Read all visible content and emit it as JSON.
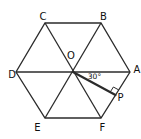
{
  "figure": {
    "labels": {
      "A": "A",
      "B": "B",
      "C": "C",
      "D": "D",
      "E": "E",
      "F": "F",
      "O": "O",
      "P": "P"
    },
    "angle_label": "30°",
    "colors": {
      "background": "#ffffff",
      "line": "#2b2b2b",
      "text": "#101010"
    }
  }
}
